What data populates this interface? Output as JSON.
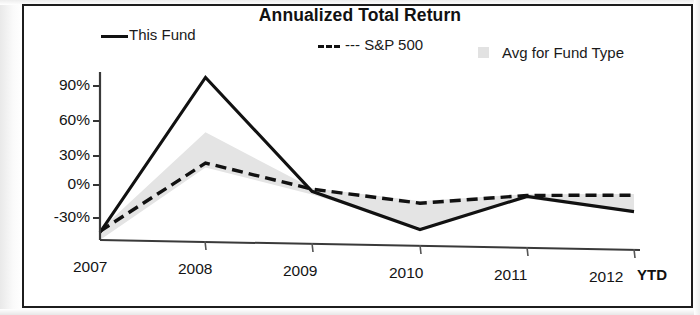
{
  "chart_data": {
    "type": "line",
    "title": "Annualized Total Return",
    "xlabel": "",
    "ylabel": "",
    "x": [
      "2007",
      "2008",
      "2009",
      "2010",
      "2011",
      "2012"
    ],
    "categories": [
      "2007",
      "2008",
      "2009",
      "2010",
      "2011",
      "2012"
    ],
    "ytick_labels": [
      "90%",
      "60%",
      "30%",
      "0%",
      "-30%"
    ],
    "ytick_values": [
      90,
      60,
      30,
      0,
      -30
    ],
    "ylim": [
      -45,
      110
    ],
    "grid": false,
    "legend_position": "top",
    "last_period_note": "YTD",
    "series": [
      {
        "name": "This Fund",
        "style": "solid",
        "color": "#111111",
        "values": [
          -38,
          105,
          3,
          -30,
          2,
          -10
        ]
      },
      {
        "name": "S&P 500",
        "style": "dashed",
        "color": "#111111",
        "values": [
          -37,
          27,
          5,
          -6,
          3,
          5
        ]
      },
      {
        "name": "Avg for Fund Type",
        "style": "shaded-band",
        "color": "#e2e2e2",
        "upper": [
          -36,
          55,
          6,
          -4,
          4,
          6
        ],
        "lower": [
          -45,
          23,
          0,
          -28,
          0,
          -11
        ]
      }
    ]
  },
  "legend": {
    "fund_label": "This Fund",
    "sp_label": "--- S&P 500",
    "avg_label": "Avg for Fund Type"
  },
  "axis": {
    "y": [
      "90%",
      "60%",
      "30%",
      "0%",
      "-30%"
    ],
    "x": [
      "2007",
      "2008",
      "2009",
      "2010",
      "2011",
      "2012"
    ],
    "ytd": "YTD"
  }
}
